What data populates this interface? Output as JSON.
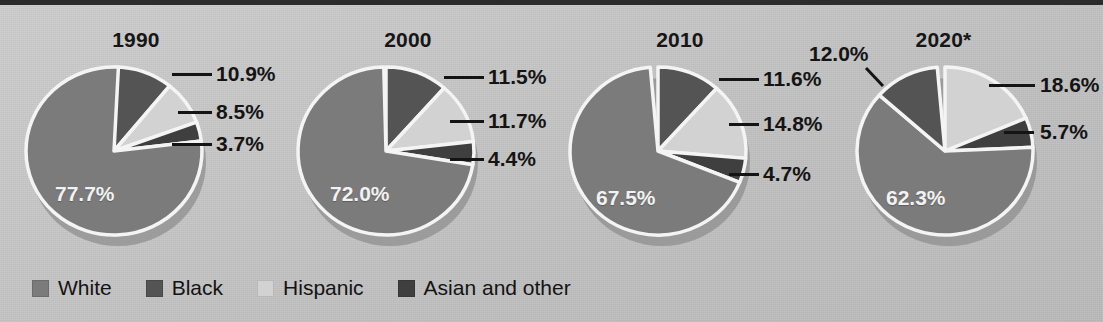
{
  "figure": {
    "background_color": "#c7c7c7",
    "top_rule_color": "#2c2c2c"
  },
  "legend": {
    "items": [
      {
        "label": "White",
        "color": "#7b7b7b",
        "swatch_icon": "square-swatch-icon"
      },
      {
        "label": "Black",
        "color": "#545454",
        "swatch_icon": "square-swatch-icon"
      },
      {
        "label": "Hispanic",
        "color": "#d2d2d2",
        "swatch_icon": "square-swatch-icon"
      },
      {
        "label": "Asian and other",
        "color": "#3f3f3f",
        "swatch_icon": "square-swatch-icon"
      }
    ]
  },
  "chart_data": {
    "type": "pie",
    "title": "",
    "legend_position": "bottom-left",
    "categories": [
      "White",
      "Black",
      "Hispanic",
      "Asian and other"
    ],
    "colors": [
      "#7b7b7b",
      "#545454",
      "#d2d2d2",
      "#3f3f3f"
    ],
    "charts": [
      {
        "title": "1990",
        "slices": [
          {
            "name": "Black",
            "value": 10.9,
            "label": "10.9%"
          },
          {
            "name": "Hispanic",
            "value": 8.5,
            "label": "8.5%"
          },
          {
            "name": "Asian and other",
            "value": 3.7,
            "label": "3.7%"
          },
          {
            "name": "White",
            "value": 77.7,
            "label": "77.7%"
          }
        ]
      },
      {
        "title": "2000",
        "slices": [
          {
            "name": "Black",
            "value": 11.5,
            "label": "11.5%"
          },
          {
            "name": "Hispanic",
            "value": 11.7,
            "label": "11.7%"
          },
          {
            "name": "Asian and other",
            "value": 4.4,
            "label": "4.4%"
          },
          {
            "name": "White",
            "value": 72.0,
            "label": "72.0%"
          }
        ]
      },
      {
        "title": "2010",
        "slices": [
          {
            "name": "Black",
            "value": 11.6,
            "label": "11.6%"
          },
          {
            "name": "Hispanic",
            "value": 14.8,
            "label": "14.8%"
          },
          {
            "name": "Asian and other",
            "value": 4.7,
            "label": "4.7%"
          },
          {
            "name": "White",
            "value": 67.5,
            "label": "67.5%"
          }
        ]
      },
      {
        "title": "2020*",
        "slices": [
          {
            "name": "Hispanic",
            "value": 18.6,
            "label": "18.6%"
          },
          {
            "name": "Asian and other",
            "value": 5.7,
            "label": "5.7%"
          },
          {
            "name": "White",
            "value": 62.3,
            "label": "62.3%"
          },
          {
            "name": "Black",
            "value": 12.0,
            "label": "12.0%"
          }
        ]
      }
    ]
  },
  "panels": {
    "p1990": {
      "title": "1990",
      "inner_label": "77.7%",
      "callouts": [
        {
          "text": "10.9%",
          "name": "callout-black"
        },
        {
          "text": "8.5%",
          "name": "callout-hispanic"
        },
        {
          "text": "3.7%",
          "name": "callout-asian"
        }
      ]
    },
    "p2000": {
      "title": "2000",
      "inner_label": "72.0%",
      "callouts": [
        {
          "text": "11.5%",
          "name": "callout-black"
        },
        {
          "text": "11.7%",
          "name": "callout-hispanic"
        },
        {
          "text": "4.4%",
          "name": "callout-asian"
        }
      ]
    },
    "p2010": {
      "title": "2010",
      "inner_label": "67.5%",
      "callouts": [
        {
          "text": "11.6%",
          "name": "callout-black"
        },
        {
          "text": "14.8%",
          "name": "callout-hispanic"
        },
        {
          "text": "4.7%",
          "name": "callout-asian"
        }
      ]
    },
    "p2020": {
      "title": "2020*",
      "inner_label": "62.3%",
      "callouts": [
        {
          "text": "12.0%",
          "name": "callout-black"
        },
        {
          "text": "18.6%",
          "name": "callout-hispanic"
        },
        {
          "text": "5.7%",
          "name": "callout-asian"
        }
      ]
    }
  }
}
